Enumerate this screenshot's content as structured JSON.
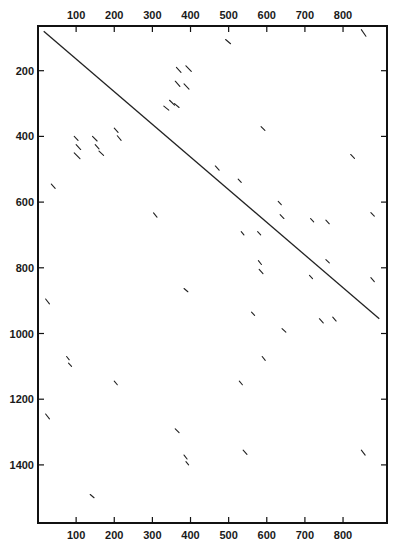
{
  "chart_data": {
    "type": "scatter",
    "subtype": "dot-plot-segments",
    "title": "",
    "xlabel": "",
    "ylabel": "",
    "xlim": [
      0,
      915
    ],
    "ylim": [
      0,
      1570
    ],
    "y_inverted": true,
    "grid": false,
    "x_ticks": [
      100,
      200,
      300,
      400,
      500,
      600,
      700,
      800
    ],
    "x_tick_labels": [
      "100",
      "200",
      "300",
      "400",
      "500",
      "600",
      "700",
      "800"
    ],
    "x_tick_label_positions": [
      "top",
      "bottom"
    ],
    "y_ticks": [
      200,
      400,
      600,
      800,
      1000,
      1200,
      1400
    ],
    "y_tick_labels": [
      "200",
      "400",
      "600",
      "800",
      "1000",
      "1200",
      "1400"
    ],
    "main_diagonal": {
      "x1": 15,
      "y1": 80,
      "x2": 895,
      "y2": 955
    },
    "segments": [
      {
        "x1": 848,
        "y1": 75,
        "x2": 860,
        "y2": 95
      },
      {
        "x1": 492,
        "y1": 105,
        "x2": 505,
        "y2": 118
      },
      {
        "x1": 363,
        "y1": 190,
        "x2": 375,
        "y2": 205
      },
      {
        "x1": 388,
        "y1": 185,
        "x2": 402,
        "y2": 202
      },
      {
        "x1": 360,
        "y1": 232,
        "x2": 372,
        "y2": 248
      },
      {
        "x1": 383,
        "y1": 240,
        "x2": 396,
        "y2": 256
      },
      {
        "x1": 345,
        "y1": 290,
        "x2": 358,
        "y2": 305
      },
      {
        "x1": 330,
        "y1": 308,
        "x2": 343,
        "y2": 320
      },
      {
        "x1": 358,
        "y1": 300,
        "x2": 370,
        "y2": 312
      },
      {
        "x1": 95,
        "y1": 400,
        "x2": 105,
        "y2": 412
      },
      {
        "x1": 100,
        "y1": 425,
        "x2": 112,
        "y2": 440
      },
      {
        "x1": 95,
        "y1": 450,
        "x2": 110,
        "y2": 468
      },
      {
        "x1": 143,
        "y1": 400,
        "x2": 155,
        "y2": 414
      },
      {
        "x1": 150,
        "y1": 425,
        "x2": 160,
        "y2": 438
      },
      {
        "x1": 160,
        "y1": 445,
        "x2": 172,
        "y2": 458
      },
      {
        "x1": 200,
        "y1": 375,
        "x2": 210,
        "y2": 388
      },
      {
        "x1": 208,
        "y1": 398,
        "x2": 218,
        "y2": 412
      },
      {
        "x1": 585,
        "y1": 370,
        "x2": 595,
        "y2": 382
      },
      {
        "x1": 35,
        "y1": 545,
        "x2": 45,
        "y2": 558
      },
      {
        "x1": 820,
        "y1": 455,
        "x2": 830,
        "y2": 467
      },
      {
        "x1": 465,
        "y1": 490,
        "x2": 475,
        "y2": 503
      },
      {
        "x1": 525,
        "y1": 530,
        "x2": 533,
        "y2": 540
      },
      {
        "x1": 630,
        "y1": 598,
        "x2": 638,
        "y2": 608
      },
      {
        "x1": 635,
        "y1": 638,
        "x2": 645,
        "y2": 650
      },
      {
        "x1": 303,
        "y1": 633,
        "x2": 312,
        "y2": 646
      },
      {
        "x1": 715,
        "y1": 650,
        "x2": 723,
        "y2": 660
      },
      {
        "x1": 755,
        "y1": 655,
        "x2": 764,
        "y2": 666
      },
      {
        "x1": 873,
        "y1": 632,
        "x2": 882,
        "y2": 643
      },
      {
        "x1": 533,
        "y1": 690,
        "x2": 540,
        "y2": 700
      },
      {
        "x1": 576,
        "y1": 690,
        "x2": 584,
        "y2": 700
      },
      {
        "x1": 578,
        "y1": 778,
        "x2": 586,
        "y2": 790
      },
      {
        "x1": 580,
        "y1": 805,
        "x2": 590,
        "y2": 818
      },
      {
        "x1": 755,
        "y1": 775,
        "x2": 764,
        "y2": 785
      },
      {
        "x1": 712,
        "y1": 823,
        "x2": 720,
        "y2": 833
      },
      {
        "x1": 873,
        "y1": 830,
        "x2": 882,
        "y2": 842
      },
      {
        "x1": 383,
        "y1": 863,
        "x2": 393,
        "y2": 873
      },
      {
        "x1": 20,
        "y1": 895,
        "x2": 30,
        "y2": 910
      },
      {
        "x1": 560,
        "y1": 935,
        "x2": 568,
        "y2": 945
      },
      {
        "x1": 738,
        "y1": 955,
        "x2": 748,
        "y2": 968
      },
      {
        "x1": 773,
        "y1": 950,
        "x2": 782,
        "y2": 962
      },
      {
        "x1": 640,
        "y1": 985,
        "x2": 650,
        "y2": 996
      },
      {
        "x1": 75,
        "y1": 1070,
        "x2": 82,
        "y2": 1080
      },
      {
        "x1": 80,
        "y1": 1090,
        "x2": 88,
        "y2": 1100
      },
      {
        "x1": 588,
        "y1": 1070,
        "x2": 596,
        "y2": 1082
      },
      {
        "x1": 200,
        "y1": 1145,
        "x2": 208,
        "y2": 1156
      },
      {
        "x1": 528,
        "y1": 1145,
        "x2": 536,
        "y2": 1156
      },
      {
        "x1": 20,
        "y1": 1245,
        "x2": 30,
        "y2": 1260
      },
      {
        "x1": 360,
        "y1": 1290,
        "x2": 370,
        "y2": 1302
      },
      {
        "x1": 383,
        "y1": 1370,
        "x2": 391,
        "y2": 1382
      },
      {
        "x1": 388,
        "y1": 1390,
        "x2": 395,
        "y2": 1400
      },
      {
        "x1": 538,
        "y1": 1355,
        "x2": 548,
        "y2": 1368
      },
      {
        "x1": 848,
        "y1": 1355,
        "x2": 858,
        "y2": 1370
      },
      {
        "x1": 137,
        "y1": 1490,
        "x2": 147,
        "y2": 1500
      }
    ]
  }
}
